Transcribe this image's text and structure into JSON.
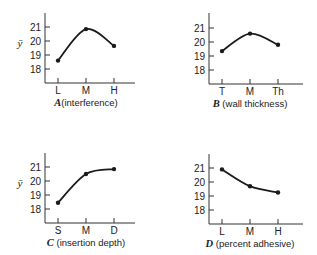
{
  "chart_data": [
    {
      "type": "line",
      "title": "",
      "factor": "A",
      "xlabel": "A (interference)",
      "xlabel_factor": "A",
      "xlabel_text": "(interference)",
      "ylabel": "ȳ",
      "categories": [
        "L",
        "M",
        "H"
      ],
      "values": [
        18.6,
        20.85,
        19.65
      ],
      "yticks": [
        18,
        19,
        20,
        21
      ],
      "ylim": [
        17.1,
        21.8
      ],
      "grid": false,
      "show_ylabel": true
    },
    {
      "type": "line",
      "title": "",
      "factor": "B",
      "xlabel": "B (wall thickness)",
      "xlabel_factor": "B",
      "xlabel_text": " (wall thickness)",
      "ylabel": "",
      "categories": [
        "T",
        "M",
        "Th"
      ],
      "values": [
        19.35,
        20.6,
        19.8
      ],
      "yticks": [
        18,
        19,
        20,
        21
      ],
      "ylim": [
        17.1,
        21.8
      ],
      "grid": false,
      "show_ylabel": false
    },
    {
      "type": "line",
      "title": "",
      "factor": "C",
      "xlabel": "C (insertion depth)",
      "xlabel_factor": "C",
      "xlabel_text": " (insertion depth)",
      "ylabel": "ȳ",
      "categories": [
        "S",
        "M",
        "D"
      ],
      "values": [
        18.45,
        20.5,
        20.85
      ],
      "yticks": [
        18,
        19,
        20,
        21
      ],
      "ylim": [
        17.1,
        21.8
      ],
      "grid": false,
      "show_ylabel": true
    },
    {
      "type": "line",
      "title": "",
      "factor": "D",
      "xlabel": "D (percent adhesive)",
      "xlabel_factor": "D",
      "xlabel_text": " (percent adhesive)",
      "ylabel": "",
      "categories": [
        "L",
        "M",
        "H"
      ],
      "values": [
        20.9,
        19.7,
        19.25
      ],
      "yticks": [
        18,
        19,
        20,
        21
      ],
      "ylim": [
        17.1,
        21.8
      ],
      "grid": false,
      "show_ylabel": false
    }
  ],
  "style": {
    "line_color": "#1a1a1a",
    "axis_color": "#333333",
    "background": "#ffffff"
  }
}
